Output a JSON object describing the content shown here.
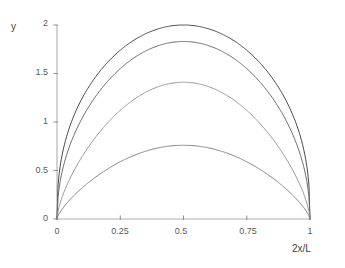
{
  "chart_data": {
    "type": "line",
    "title": "",
    "subtitle": "",
    "xlabel": "2x/L",
    "ylabel": "y",
    "xlim": [
      0,
      1
    ],
    "ylim": [
      0,
      2
    ],
    "grid": false,
    "legend": "none",
    "xticks": [
      "0",
      "0.25",
      "0.5",
      "0.75",
      "1"
    ],
    "xtick_values": [
      0,
      0.25,
      0.5,
      0.75,
      1
    ],
    "yticks": [
      "0",
      "0.5",
      "1",
      "1.5",
      "2"
    ],
    "ytick_values": [
      0,
      0.5,
      1,
      1.5,
      2
    ],
    "x": [
      0,
      0.05,
      0.1,
      0.15,
      0.2,
      0.25,
      0.3,
      0.35,
      0.4,
      0.45,
      0.5,
      0.55,
      0.6,
      0.65,
      0.7,
      0.75,
      0.8,
      0.85,
      0.9,
      0.95,
      1
    ],
    "series": [
      {
        "name": "curve-1",
        "color": "#4a4a4a",
        "peak": 2.0,
        "values": [
          0,
          0.47,
          0.89,
          1.24,
          1.54,
          1.74,
          1.88,
          1.96,
          2.0,
          2.0,
          2.0,
          2.0,
          2.0,
          1.96,
          1.88,
          1.74,
          1.54,
          1.24,
          0.89,
          0.47,
          0
        ]
      },
      {
        "name": "curve-2",
        "color": "#6e6e6e",
        "peak": 1.83,
        "values": [
          0,
          0.39,
          0.75,
          1.07,
          1.34,
          1.55,
          1.7,
          1.79,
          1.83,
          1.83,
          1.83,
          1.83,
          1.83,
          1.79,
          1.7,
          1.55,
          1.34,
          1.07,
          0.75,
          0.39,
          0
        ]
      },
      {
        "name": "curve-3",
        "color": "#9a9a9a",
        "peak": 1.41,
        "values": [
          0,
          0.26,
          0.51,
          0.74,
          0.95,
          1.12,
          1.26,
          1.35,
          1.4,
          1.41,
          1.41,
          1.41,
          1.4,
          1.35,
          1.26,
          1.12,
          0.95,
          0.74,
          0.51,
          0.26,
          0
        ]
      },
      {
        "name": "curve-4",
        "color": "#848484",
        "peak": 0.76,
        "values": [
          0,
          0.13,
          0.26,
          0.38,
          0.49,
          0.59,
          0.67,
          0.73,
          0.76,
          0.76,
          0.76,
          0.76,
          0.76,
          0.73,
          0.67,
          0.59,
          0.49,
          0.38,
          0.26,
          0.13,
          0
        ]
      }
    ],
    "axis_color": "#b0b0b0",
    "tick_color": "#8a8a8a"
  },
  "axes": {
    "ylabel": "y",
    "xlabel": "2x/L"
  },
  "ylabels": {
    "t0": "0",
    "t1": "0.5",
    "t2": "1",
    "t3": "1.5",
    "t4": "2"
  },
  "xlabels": {
    "t0": "0",
    "t1": "0.25",
    "t2": "0.5",
    "t3": "0.75",
    "t4": "1"
  }
}
